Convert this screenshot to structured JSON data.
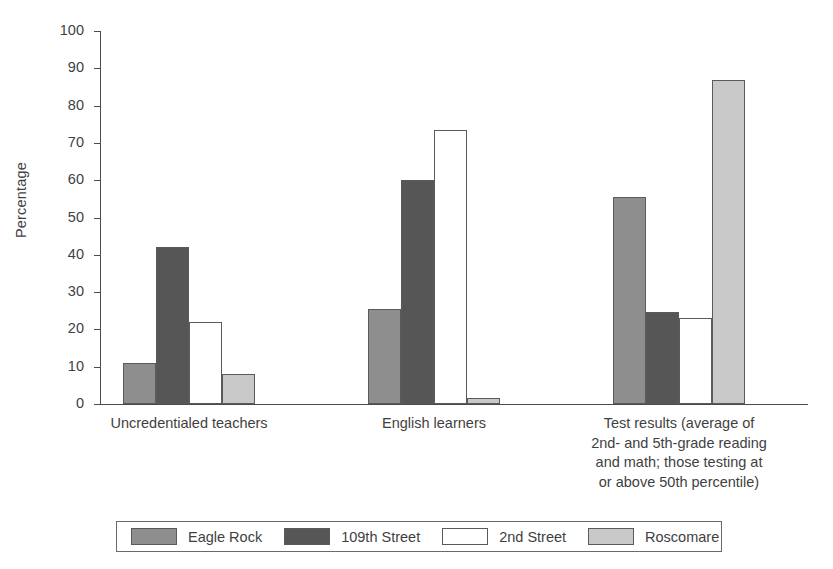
{
  "chart_data": {
    "type": "bar",
    "title": "",
    "xlabel": "",
    "ylabel": "Percentage",
    "ylim": [
      0,
      100
    ],
    "ytick_step": 10,
    "grid": false,
    "legend_position": "bottom",
    "yticks": [
      "100",
      "90",
      "80",
      "70",
      "60",
      "50",
      "40",
      "30",
      "20",
      "10",
      "0"
    ],
    "categories": [
      "Uncredentialed teachers",
      "English learners",
      "Test results (average of 2nd- and 5th-grade reading and math; those testing at or above 50th percentile)"
    ],
    "category_label_lines": [
      [
        "Uncredentialed teachers"
      ],
      [
        "English learners"
      ],
      [
        "Test results (average of",
        "2nd- and 5th-grade reading",
        "and math; those testing at",
        "or above 50th percentile)"
      ]
    ],
    "series": [
      {
        "name": "Eagle Rock",
        "color": "#8e8e8e",
        "swatch_class": "swatch-eagle",
        "values": [
          11,
          25.5,
          55.5
        ]
      },
      {
        "name": "109th Street",
        "color": "#565656",
        "swatch_class": "swatch-109th",
        "values": [
          42,
          60,
          24.8
        ]
      },
      {
        "name": "2nd Street",
        "color": "#ffffff",
        "swatch_class": "swatch-2nd",
        "values": [
          22,
          73.5,
          23
        ]
      },
      {
        "name": "Roscomare",
        "color": "#c8c8c8",
        "swatch_class": "swatch-rosco",
        "values": [
          8,
          1.7,
          87
        ]
      }
    ]
  },
  "legend": {
    "entries": [
      {
        "label": "Eagle Rock"
      },
      {
        "label": "109th Street"
      },
      {
        "label": "2nd Street"
      },
      {
        "label": "Roscomare"
      }
    ]
  }
}
